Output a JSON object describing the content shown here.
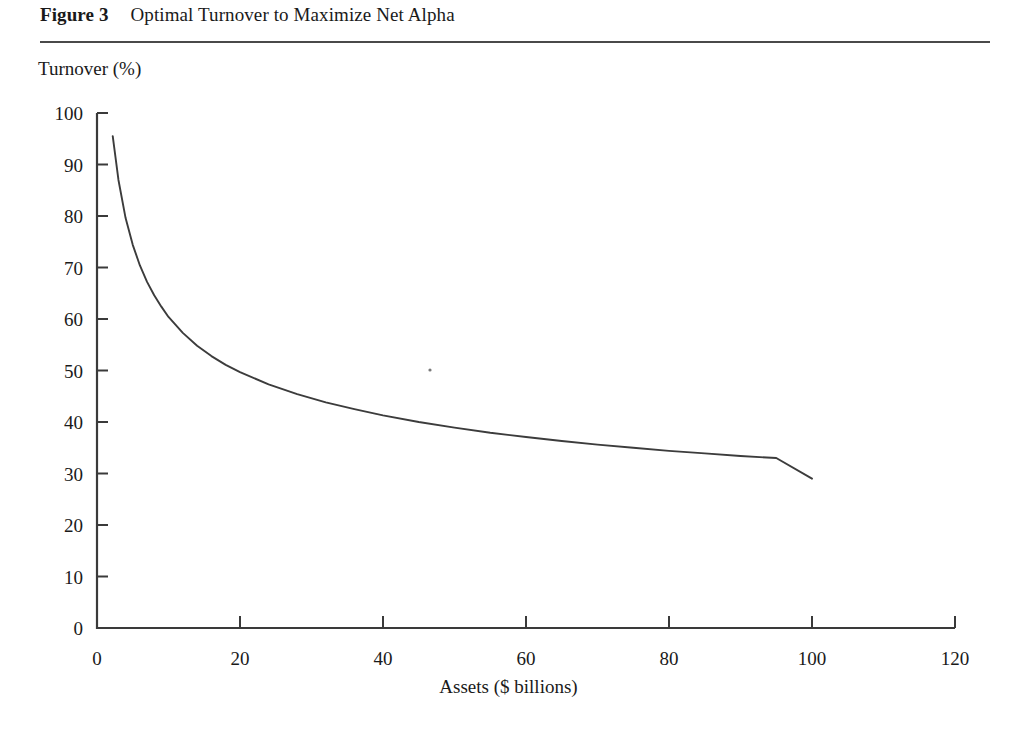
{
  "figure": {
    "number": "Figure 3",
    "title": "Optimal Turnover to Maximize Net Alpha"
  },
  "chart_data": {
    "type": "line",
    "title": "Optimal Turnover to Maximize Net Alpha",
    "xlabel": "Assets ($ billions)",
    "ylabel": "Turnover (%)",
    "xlim": [
      0,
      120
    ],
    "ylim": [
      0,
      100
    ],
    "xticks": [
      0,
      20,
      40,
      60,
      80,
      100,
      120
    ],
    "yticks": [
      0,
      10,
      20,
      30,
      40,
      50,
      60,
      70,
      80,
      90,
      100
    ],
    "grid": false,
    "legend": "none",
    "series": [
      {
        "name": "Optimal turnover",
        "x": [
          2.2,
          3,
          4,
          5,
          6,
          7,
          8,
          9,
          10,
          12,
          14,
          16,
          18,
          20,
          24,
          28,
          32,
          36,
          40,
          45,
          50,
          55,
          60,
          65,
          70,
          75,
          80,
          85,
          90,
          95,
          100
        ],
        "y": [
          95.5,
          87.0,
          79.6,
          74.4,
          70.4,
          67.2,
          64.6,
          62.4,
          60.4,
          57.3,
          54.8,
          52.8,
          51.1,
          49.7,
          47.3,
          45.4,
          43.8,
          42.5,
          41.3,
          40.0,
          38.9,
          37.9,
          37.1,
          36.3,
          35.6,
          35.0,
          34.4,
          33.9,
          33.4,
          33.0,
          29.0
        ]
      }
    ],
    "curve_note": "Monotonically decreasing convex power-law style decay from about 95% turnover at $2B of assets to about 29% at $100B of assets."
  },
  "axes": {
    "y_tick_labels": [
      "100",
      "90",
      "80",
      "70",
      "60",
      "50",
      "40",
      "30",
      "20",
      "10",
      "0"
    ],
    "x_tick_labels": [
      "0",
      "20",
      "40",
      "60",
      "80",
      "100",
      "120"
    ]
  }
}
